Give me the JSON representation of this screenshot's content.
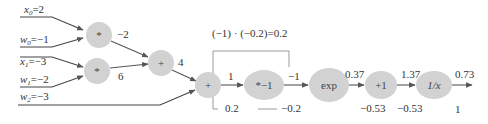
{
  "inputs": [
    {
      "var": "x",
      "sub": "0",
      "value": "=2"
    },
    {
      "var": "w",
      "sub": "0",
      "value": "=−1"
    },
    {
      "var": "x",
      "sub": "1",
      "value": "=−3"
    },
    {
      "var": "w",
      "sub": "1",
      "value": "=−2"
    },
    {
      "var": "w",
      "sub": "2",
      "value": "=−3"
    }
  ],
  "nodes": {
    "mul0": "*",
    "mul1": "*",
    "add0": "+",
    "add1": "+",
    "neg": "*−1",
    "exp": "exp",
    "plus1": "+1",
    "recip": "1/x"
  },
  "forward_values": {
    "mul0_out": "−2",
    "mul1_out": "6",
    "add0_out": "4",
    "add1_out": "1",
    "neg_out": "−1",
    "exp_out": "0.37",
    "plus1_out": "1.37",
    "recip_out": "0.73"
  },
  "gradients": {
    "add1_grad": "0.2",
    "neg_grad": "−0.2",
    "exp_grad": "−0.53",
    "plus1_grad": "−0.53",
    "recip_grad": "1"
  },
  "annotation": "(−1) · (−0.2)=0.2",
  "colors": {
    "node_fill": "#d2d2d2",
    "edge": "#555555",
    "bracket": "#999999"
  }
}
